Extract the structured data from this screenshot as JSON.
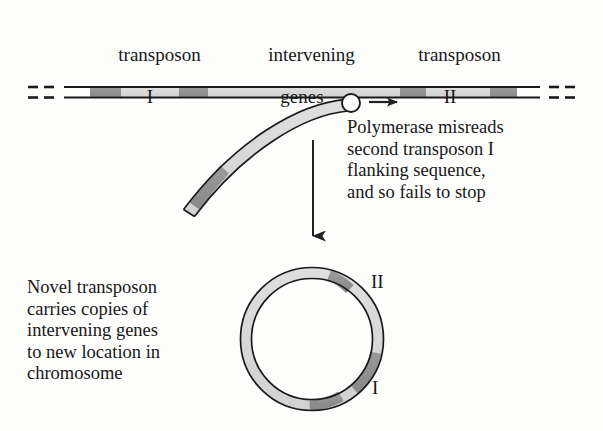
{
  "figure": {
    "background_color": "#fdfdfc",
    "ink_color": "#181818"
  },
  "headers": {
    "transposon_1": {
      "line1": "transposon",
      "line2": "I"
    },
    "intervening": {
      "line1": "intervening",
      "line2": "genes"
    },
    "transposon_2": {
      "line1": "transposon",
      "line2": "II"
    }
  },
  "annotations": {
    "polymerase_note": "Polymerase misreads\nsecond transposon I\nflanking sequence,\nand so fails to stop",
    "novel_transposon_note": "Novel transposon\ncarries copies of\nintervening genes\nto new location in\nchromosome"
  },
  "circle_labels": {
    "top_right": "II",
    "bottom_right": "I"
  },
  "colors": {
    "band_dark": "#8f8f8f",
    "band_light": "#d5d5d5",
    "strand_fill": "#d9d9d9",
    "outline": "#1a1a1a",
    "arrow": "#2a2a2a"
  },
  "diagram": {
    "chromosome": {
      "y_top": 86,
      "y_bottom": 98,
      "x_start": 64,
      "x_end": 540,
      "dashes_left": [
        [
          28,
          38
        ],
        [
          44,
          54
        ]
      ],
      "dashes_right": [
        [
          549,
          559
        ],
        [
          565,
          575
        ]
      ],
      "segments": [
        {
          "name": "transposon-I-band-left",
          "x": 90,
          "width": 31,
          "shade": "dark"
        },
        {
          "name": "transposon-I-spacer",
          "x": 121,
          "width": 58,
          "shade": "light"
        },
        {
          "name": "transposon-I-band-right",
          "x": 179,
          "width": 29,
          "shade": "dark"
        },
        {
          "name": "intervening-genes",
          "x": 208,
          "width": 192,
          "shade": "light"
        },
        {
          "name": "transposon-II-band-left",
          "x": 400,
          "width": 26,
          "shade": "dark"
        },
        {
          "name": "transposon-II-spacer",
          "x": 426,
          "width": 64,
          "shade": "light"
        },
        {
          "name": "transposon-II-band-right",
          "x": 490,
          "width": 27,
          "shade": "dark"
        }
      ]
    },
    "polymerase": {
      "cx": 351,
      "cy": 103,
      "r": 9
    },
    "polymerase_arrow": {
      "x1": 369,
      "y1": 102,
      "x2": 401,
      "y2": 102
    },
    "peeling_strand": {
      "start": [
        348,
        106
      ],
      "end": [
        189,
        218
      ],
      "dark_band": {
        "position_fraction": 0.66,
        "length_fraction": 0.12
      }
    },
    "process_arrow": {
      "x": 313,
      "y1": 140,
      "y2": 248
    },
    "circular_transposon": {
      "cx": 312,
      "cy": 339,
      "radius": 66,
      "ring_thickness": 11,
      "dark_arcs": [
        {
          "name": "arc-top",
          "start_deg": 285,
          "end_deg": 305
        },
        {
          "name": "arc-right",
          "start_deg": 50,
          "end_deg": 78
        },
        {
          "name": "arc-bottom",
          "start_deg": 92,
          "end_deg": 118
        }
      ]
    }
  }
}
